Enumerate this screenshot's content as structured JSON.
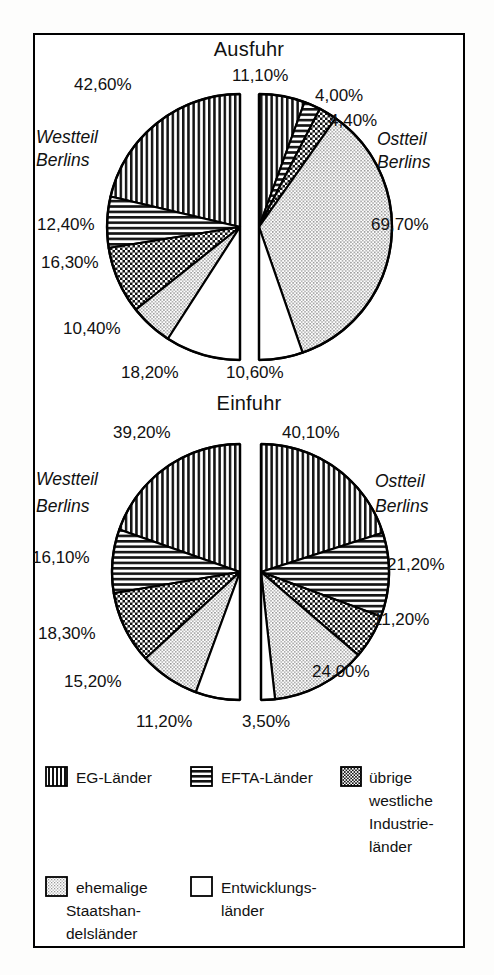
{
  "document": {
    "kind": "scanned-statistical-figure",
    "frame_border_color": "#000000",
    "background_color": "#ffffff"
  },
  "legend": {
    "name": "chart-legend",
    "row1": [
      {
        "key": "eg",
        "label": "EG-Länder",
        "pattern": "vertical-lines"
      },
      {
        "key": "efta",
        "label": "EFTA-Länder",
        "pattern": "horizontal-lines"
      },
      {
        "key": "west",
        "label": "übrige\nwestliche\nIndustrie-\nländer",
        "label_lines": [
          "übrige",
          "westliche",
          "Industrie-",
          "länder"
        ],
        "pattern": "checkerboard"
      }
    ],
    "row2": [
      {
        "key": "staat",
        "label_lines": [
          "ehemalige",
          "Staatshan-",
          "delsländer"
        ],
        "pattern": "light-stipple"
      },
      {
        "key": "entw",
        "label_lines": [
          "Entwicklungs-",
          "länder"
        ],
        "pattern": "solid-white"
      }
    ]
  },
  "chart_data": [
    {
      "type": "pie",
      "title": "Ausfuhr",
      "name": "ausfuhr-chart",
      "halves": [
        {
          "name": "westteil-berlins",
          "side": "left",
          "side_label_lines": [
            "Westteil",
            "Berlins"
          ],
          "categories": [
            "EG-Länder",
            "EFTA-Länder",
            "übrige westliche Industrieländer",
            "ehemalige Staatshandelsländer",
            "Entwicklungsländer"
          ],
          "patterns": [
            "vertical-lines",
            "horizontal-lines",
            "checkerboard",
            "light-stipple",
            "solid-white"
          ],
          "values": [
            42.6,
            12.4,
            16.3,
            10.4,
            18.2
          ],
          "labels": [
            "42,60%",
            "12,40%",
            "16,30%",
            "10,40%",
            "18,20%"
          ]
        },
        {
          "name": "ostteil-berlins",
          "side": "right",
          "side_label_lines": [
            "Ostteil",
            "Berlins"
          ],
          "categories": [
            "EG-Länder",
            "EFTA-Länder",
            "übrige westliche Industrieländer",
            "ehemalige Staatshandelsländer",
            "Entwicklungsländer"
          ],
          "patterns": [
            "vertical-lines",
            "horizontal-lines",
            "checkerboard",
            "light-stipple",
            "solid-white"
          ],
          "values": [
            11.1,
            4.0,
            4.4,
            69.7,
            10.6
          ],
          "labels": [
            "11,10%",
            "4,00%",
            "4,40%",
            "69,70%",
            "10,60%"
          ]
        }
      ]
    },
    {
      "type": "pie",
      "title": "Einfuhr",
      "name": "einfuhr-chart",
      "halves": [
        {
          "name": "westteil-berlins",
          "side": "left",
          "side_label_lines": [
            "Westteil",
            "Berlins"
          ],
          "categories": [
            "EG-Länder",
            "EFTA-Länder",
            "übrige westliche Industrieländer",
            "ehemalige Staatshandelsländer",
            "Entwicklungsländer"
          ],
          "patterns": [
            "vertical-lines",
            "horizontal-lines",
            "checkerboard",
            "light-stipple",
            "solid-white"
          ],
          "values": [
            39.2,
            16.1,
            18.3,
            15.2,
            11.2
          ],
          "labels": [
            "39,20%",
            "16,10%",
            "18,30%",
            "15,20%",
            "11,20%"
          ]
        },
        {
          "name": "ostteil-berlins",
          "side": "right",
          "side_label_lines": [
            "Ostteil",
            "Berlins"
          ],
          "categories": [
            "EG-Länder",
            "EFTA-Länder",
            "übrige westliche Industrieländer",
            "ehemalige Staatshandelsländer",
            "Entwicklungsländer"
          ],
          "patterns": [
            "vertical-lines",
            "horizontal-lines",
            "checkerboard",
            "light-stipple",
            "solid-white"
          ],
          "values": [
            40.1,
            21.2,
            11.2,
            24.0,
            3.5
          ],
          "labels": [
            "40,10%",
            "21,20%",
            "11,20%",
            "24,00%",
            "3,50%"
          ]
        }
      ]
    }
  ],
  "text": {
    "titles": {
      "ausfuhr": "Ausfuhr",
      "einfuhr": "Einfuhr"
    },
    "west_line1": "Westteil",
    "west_line2": "Berlins",
    "ost_line1": "Ostteil",
    "ost_line2": "Berlins",
    "legend": {
      "eg": "EG-Länder",
      "efta": "EFTA-Länder",
      "west1": "übrige",
      "west2": "westliche",
      "west3": "Industrie-",
      "west4": "länder",
      "staat1": "ehemalige",
      "staat2": "Staatshan-",
      "staat3": "delsländer",
      "entw1": "Entwicklungs-",
      "entw2": "länder"
    },
    "ausfuhr_west": {
      "p0": "42,60%",
      "p1": "12,40%",
      "p2": "16,30%",
      "p3": "10,40%",
      "p4": "18,20%"
    },
    "ausfuhr_ost": {
      "p0": "11,10%",
      "p1": "4,00%",
      "p2": "4,40%",
      "p3": "69,70%",
      "p4": "10,60%"
    },
    "einfuhr_west": {
      "p0": "39,20%",
      "p1": "16,10%",
      "p2": "18,30%",
      "p3": "15,20%",
      "p4": "11,20%"
    },
    "einfuhr_ost": {
      "p0": "40,10%",
      "p1": "21,20%",
      "p2": "11,20%",
      "p3": "24,00%",
      "p4": "3,50%"
    }
  }
}
